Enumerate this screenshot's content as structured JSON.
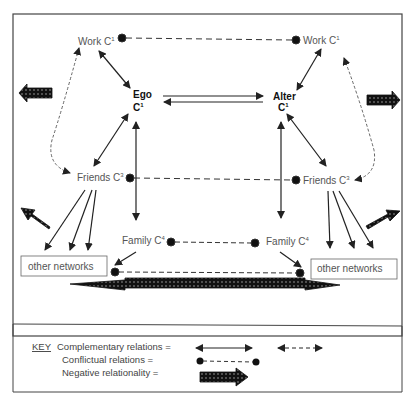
{
  "diagram": {
    "nodes": {
      "work_left": {
        "label": "Work C",
        "sup": "1"
      },
      "work_right": {
        "label": "Work C",
        "sup": "1"
      },
      "ego": {
        "label": "Ego",
        "sub": "C",
        "sup": "1"
      },
      "alter": {
        "label": "Alter",
        "sub": "C",
        "sup": "1"
      },
      "friends_left": {
        "label": "Friends C",
        "sup": "3"
      },
      "friends_right": {
        "label": "Friends C",
        "sup": "3"
      },
      "family_left": {
        "label": "Family C",
        "sup": "4"
      },
      "family_right": {
        "label": "Family C",
        "sup": "4"
      },
      "other_left": {
        "label": "other networks"
      },
      "other_right": {
        "label": "other networks"
      }
    },
    "relations": [
      {
        "from": "work_left",
        "to": "work_right",
        "type": "conflictual"
      },
      {
        "from": "friends_left",
        "to": "friends_right",
        "type": "conflictual"
      },
      {
        "from": "family_left",
        "to": "family_right",
        "type": "conflictual"
      },
      {
        "from": "other_left",
        "to": "other_right",
        "type": "conflictual"
      },
      {
        "from": "work_left",
        "to": "ego",
        "type": "complementary"
      },
      {
        "from": "friends_left",
        "to": "ego",
        "type": "complementary"
      },
      {
        "from": "work_right",
        "to": "alter",
        "type": "complementary"
      },
      {
        "from": "friends_right",
        "to": "alter",
        "type": "complementary"
      },
      {
        "from": "ego",
        "to": "alter",
        "type": "exchange"
      },
      {
        "from": "work_left",
        "to": "friends_left",
        "type": "complementary-dashed"
      },
      {
        "from": "work_right",
        "to": "friends_right",
        "type": "complementary-dashed"
      },
      {
        "from": "other_left",
        "to": "other_right",
        "type": "negative-relationality"
      }
    ]
  },
  "key": {
    "title": "KEY",
    "complementary": "Complementary relations =",
    "conflictual": "Conflictual relations =",
    "negative": "Negative relationality ="
  }
}
